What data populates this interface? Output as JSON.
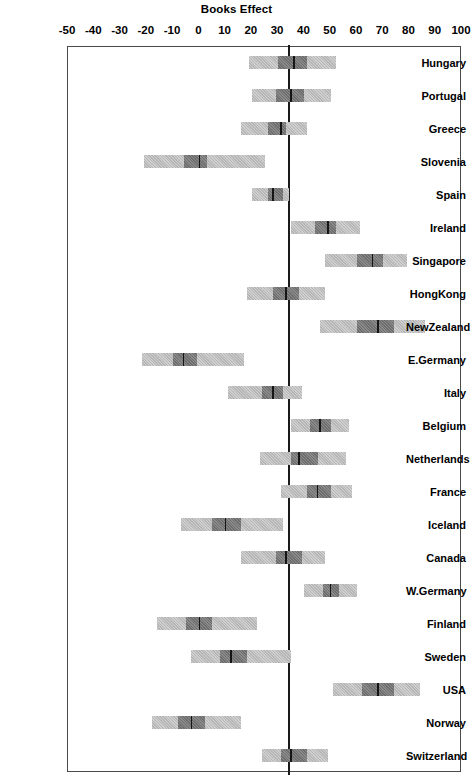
{
  "chart_data": {
    "type": "bar",
    "title": "Books Effect",
    "xlabel": "",
    "ylabel": "",
    "xlim": [
      -50,
      100
    ],
    "xticks": [
      -50,
      -40,
      -30,
      -20,
      -10,
      0,
      10,
      20,
      30,
      40,
      50,
      60,
      70,
      80,
      90,
      100
    ],
    "xticklabels": [
      "-50",
      "-40",
      "-30",
      "-20",
      "-10",
      "0",
      "10",
      "20",
      "30",
      "40",
      "50",
      "60",
      "70",
      "80",
      "90",
      "100"
    ],
    "grid": false,
    "legend": null,
    "reference_line": 34,
    "orientation": "horizontal",
    "note": "Each row is a confidence-interval band: light outer interval, dark inner interval, thin dark point estimate.",
    "categories": [
      "Hungary",
      "Portugal",
      "Greece",
      "Slovenia",
      "Spain",
      "Ireland",
      "Singapore",
      "HongKong",
      "NewZealand",
      "E.Germany",
      "Italy",
      "Belgium",
      "Netherlands",
      "France",
      "Iceland",
      "Canada",
      "W.Germany",
      "Finland",
      "Sweden",
      "USA",
      "Norway",
      "Switzerland"
    ],
    "series": [
      {
        "name": "Books Effect interval",
        "points": [
          {
            "category": "Hungary",
            "outer_low": 19,
            "outer_high": 52,
            "inner_low": 30,
            "inner_high": 41,
            "estimate": 36
          },
          {
            "category": "Portugal",
            "outer_low": 20,
            "outer_high": 50,
            "inner_low": 29,
            "inner_high": 40,
            "estimate": 35
          },
          {
            "category": "Greece",
            "outer_low": 16,
            "outer_high": 41,
            "inner_low": 26,
            "inner_high": 33,
            "estimate": 31
          },
          {
            "category": "Slovenia",
            "outer_low": -21,
            "outer_high": 25,
            "inner_low": -6,
            "inner_high": 3,
            "estimate": 0
          },
          {
            "category": "Spain",
            "outer_low": 20,
            "outer_high": 34,
            "inner_low": 26,
            "inner_high": 32,
            "estimate": 28
          },
          {
            "category": "Ireland",
            "outer_low": 35,
            "outer_high": 61,
            "inner_low": 44,
            "inner_high": 52,
            "estimate": 49
          },
          {
            "category": "Singapore",
            "outer_low": 48,
            "outer_high": 79,
            "inner_low": 60,
            "inner_high": 70,
            "estimate": 66
          },
          {
            "category": "HongKong",
            "outer_low": 18,
            "outer_high": 48,
            "inner_low": 28,
            "inner_high": 38,
            "estimate": 33
          },
          {
            "category": "NewZealand",
            "outer_low": 46,
            "outer_high": 86,
            "inner_low": 60,
            "inner_high": 74,
            "estimate": 68
          },
          {
            "category": "E.Germany",
            "outer_low": -22,
            "outer_high": 17,
            "inner_low": -10,
            "inner_high": -1,
            "estimate": -6
          },
          {
            "category": "Italy",
            "outer_low": 11,
            "outer_high": 39,
            "inner_low": 24,
            "inner_high": 32,
            "estimate": 28
          },
          {
            "category": "Belgium",
            "outer_low": 35,
            "outer_high": 57,
            "inner_low": 42,
            "inner_high": 50,
            "estimate": 46
          },
          {
            "category": "Netherlands",
            "outer_low": 23,
            "outer_high": 56,
            "inner_low": 35,
            "inner_high": 45,
            "estimate": 38
          },
          {
            "category": "France",
            "outer_low": 31,
            "outer_high": 58,
            "inner_low": 41,
            "inner_high": 50,
            "estimate": 45
          },
          {
            "category": "Iceland",
            "outer_low": -7,
            "outer_high": 32,
            "inner_low": 5,
            "inner_high": 16,
            "estimate": 10
          },
          {
            "category": "Canada",
            "outer_low": 16,
            "outer_high": 48,
            "inner_low": 29,
            "inner_high": 39,
            "estimate": 33
          },
          {
            "category": "W.Germany",
            "outer_low": 40,
            "outer_high": 60,
            "inner_low": 47,
            "inner_high": 53,
            "estimate": 50
          },
          {
            "category": "Finland",
            "outer_low": -16,
            "outer_high": 22,
            "inner_low": -5,
            "inner_high": 5,
            "estimate": 0
          },
          {
            "category": "Sweden",
            "outer_low": -3,
            "outer_high": 35,
            "inner_low": 8,
            "inner_high": 18,
            "estimate": 12
          },
          {
            "category": "USA",
            "outer_low": 51,
            "outer_high": 84,
            "inner_low": 62,
            "inner_high": 74,
            "estimate": 68
          },
          {
            "category": "Norway",
            "outer_low": -18,
            "outer_high": 16,
            "inner_low": -8,
            "inner_high": 2,
            "estimate": -3
          },
          {
            "category": "Switzerland",
            "outer_low": 24,
            "outer_high": 49,
            "inner_low": 31,
            "inner_high": 41,
            "estimate": 35
          }
        ]
      }
    ]
  }
}
